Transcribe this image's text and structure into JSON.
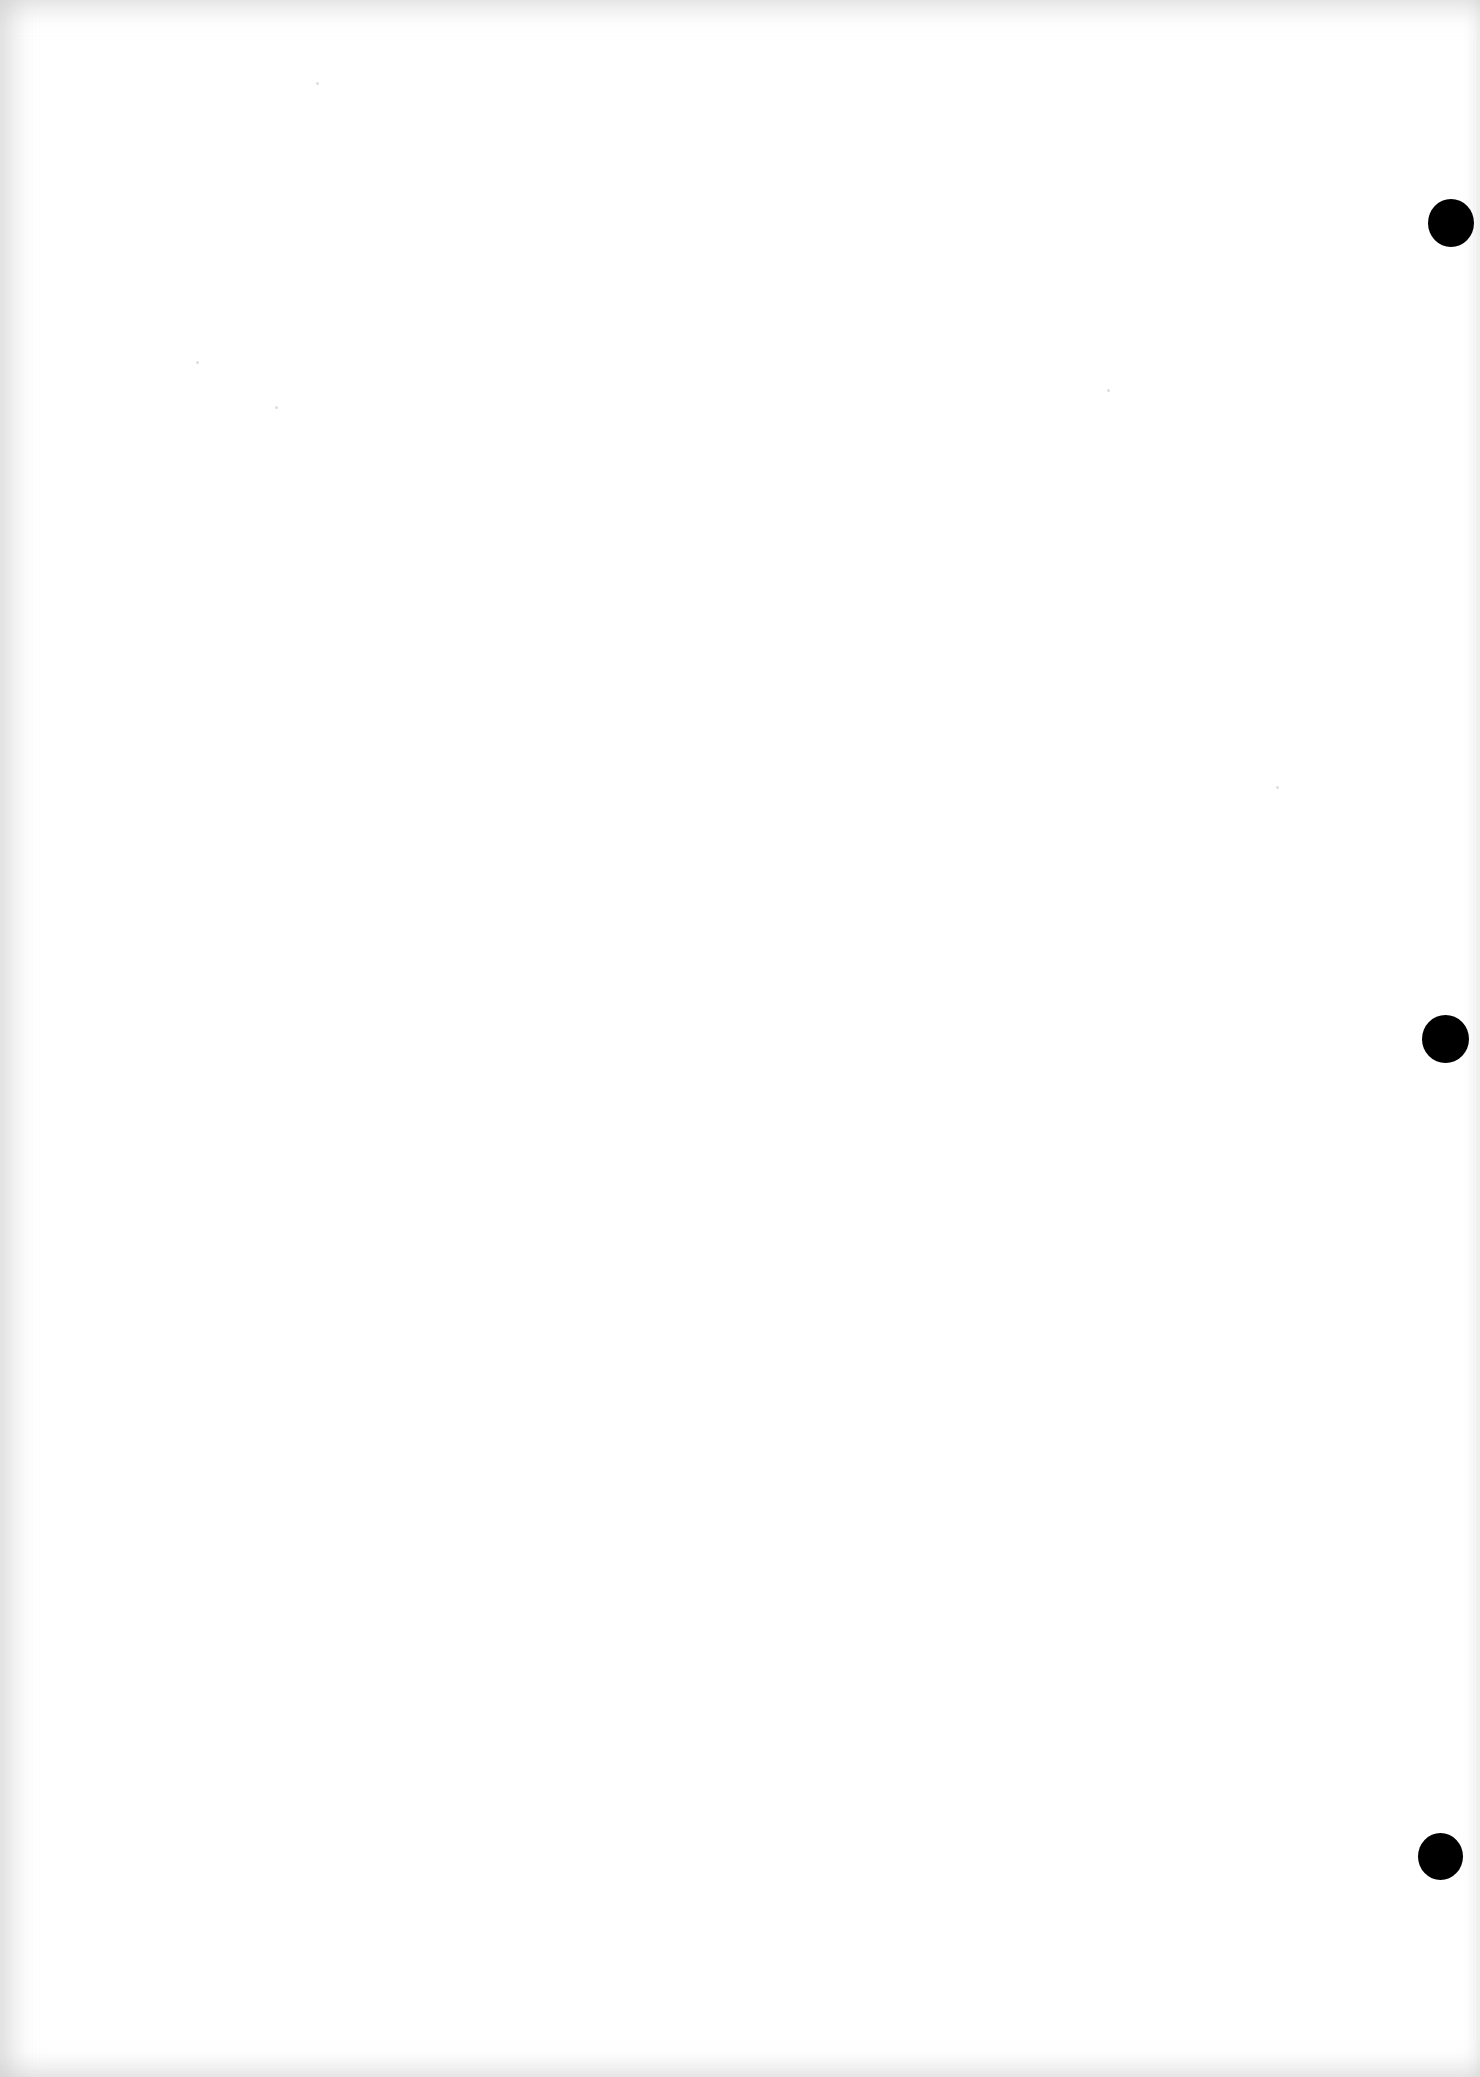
{
  "document": {
    "type": "blank scanned page",
    "text_content": "",
    "punch_holes": [
      {
        "position": "top-right",
        "color": "#000000"
      },
      {
        "position": "middle-right",
        "color": "#000000"
      },
      {
        "position": "bottom-right",
        "color": "#000000"
      }
    ],
    "background_color": "#ffffff"
  }
}
